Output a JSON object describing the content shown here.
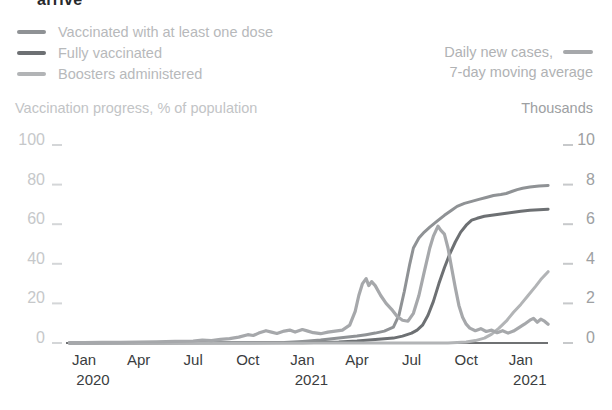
{
  "title_fragment": "arrive",
  "legend": {
    "items": [
      {
        "label": "Vaccinated with at least one dose",
        "color_key": "first_dose"
      },
      {
        "label": "Fully vaccinated",
        "color_key": "fully_vaccinated"
      },
      {
        "label": "Boosters administered",
        "color_key": "boosters"
      }
    ],
    "right_line1": "Daily new cases,",
    "right_line2": "7-day moving average"
  },
  "axes": {
    "left_title": "Vaccination progress, % of population",
    "right_title": "Thousands",
    "left_ticks": [
      100,
      80,
      60,
      40,
      20,
      0
    ],
    "right_ticks": [
      10,
      8,
      6,
      4,
      2,
      0
    ],
    "x_ticks": [
      {
        "m": 0,
        "label": "Jan",
        "year": "2020"
      },
      {
        "m": 3,
        "label": "Apr"
      },
      {
        "m": 6,
        "label": "Jul"
      },
      {
        "m": 9,
        "label": "Oct"
      },
      {
        "m": 12,
        "label": "Jan",
        "year": "2021"
      },
      {
        "m": 15,
        "label": "Apr"
      },
      {
        "m": 18,
        "label": "Jul"
      },
      {
        "m": 21,
        "label": "Oct"
      },
      {
        "m": 24,
        "label": "Jan",
        "year": "2021"
      }
    ]
  },
  "colors": {
    "first_dose": "#8f9295",
    "fully_vaccinated": "#6d7073",
    "boosters": "#b2b4b6",
    "daily_cases": "#a6a8ab",
    "tick_dash_left": "#d4d6d8",
    "tick_dash_right": "#c7c9cb",
    "baseline": "#3f4245"
  },
  "chart_data": {
    "type": "line",
    "x_unit": "months since Jan 2020 (0 = Jan 2020)",
    "x_range": [
      -0.8,
      25.5
    ],
    "left_axis": {
      "label": "Vaccination progress, % of population",
      "range": [
        0,
        100
      ]
    },
    "right_axis": {
      "label": "Daily new cases, 7-day moving average, Thousands",
      "range": [
        0,
        10
      ]
    },
    "grid": false,
    "legend_position": "top",
    "series": [
      {
        "name": "Vaccinated with at least one dose",
        "axis": "left",
        "unit": "% of population",
        "color_key": "first_dose",
        "width": 3,
        "points": [
          [
            -0.8,
            0
          ],
          [
            6,
            0.1
          ],
          [
            11,
            0.2
          ],
          [
            12,
            0.8
          ],
          [
            13,
            1.5
          ],
          [
            14,
            2.5
          ],
          [
            15,
            3.5
          ],
          [
            15.5,
            4.2
          ],
          [
            16,
            5
          ],
          [
            16.5,
            6
          ],
          [
            17,
            8
          ],
          [
            17.3,
            14
          ],
          [
            17.6,
            26
          ],
          [
            17.9,
            40
          ],
          [
            18.1,
            48
          ],
          [
            18.4,
            53
          ],
          [
            18.7,
            56
          ],
          [
            19,
            58.5
          ],
          [
            19.4,
            61.5
          ],
          [
            19.8,
            64.5
          ],
          [
            20.2,
            67
          ],
          [
            20.5,
            69
          ],
          [
            20.9,
            70.5
          ],
          [
            21.3,
            71.5
          ],
          [
            21.7,
            72.5
          ],
          [
            22.1,
            73.5
          ],
          [
            22.5,
            74.5
          ],
          [
            22.9,
            75
          ],
          [
            23.2,
            75.5
          ],
          [
            23.5,
            76.5
          ],
          [
            23.8,
            77.5
          ],
          [
            24.1,
            78.2
          ],
          [
            24.5,
            78.8
          ],
          [
            25,
            79.3
          ],
          [
            25.5,
            79.6
          ]
        ]
      },
      {
        "name": "Fully vaccinated",
        "axis": "left",
        "unit": "% of population",
        "color_key": "fully_vaccinated",
        "width": 3,
        "points": [
          [
            -0.8,
            0
          ],
          [
            12,
            0.1
          ],
          [
            14,
            0.5
          ],
          [
            15,
            1
          ],
          [
            16,
            1.8
          ],
          [
            17,
            2.5
          ],
          [
            17.5,
            3.5
          ],
          [
            18,
            5
          ],
          [
            18.3,
            6.5
          ],
          [
            18.6,
            9
          ],
          [
            18.9,
            14
          ],
          [
            19.2,
            21
          ],
          [
            19.5,
            30
          ],
          [
            19.8,
            38
          ],
          [
            20.1,
            45
          ],
          [
            20.4,
            51
          ],
          [
            20.7,
            56
          ],
          [
            21,
            59.5
          ],
          [
            21.3,
            62
          ],
          [
            21.6,
            63
          ],
          [
            22,
            64
          ],
          [
            22.4,
            64.5
          ],
          [
            22.8,
            65
          ],
          [
            23.2,
            65.5
          ],
          [
            23.6,
            66
          ],
          [
            24,
            66.5
          ],
          [
            24.5,
            67
          ],
          [
            25,
            67.3
          ],
          [
            25.5,
            67.5
          ]
        ]
      },
      {
        "name": "Boosters administered",
        "axis": "left",
        "unit": "% of population",
        "color_key": "boosters",
        "width": 3,
        "points": [
          [
            -0.8,
            0
          ],
          [
            20,
            0
          ],
          [
            21,
            0.5
          ],
          [
            21.5,
            1.2
          ],
          [
            22,
            2.5
          ],
          [
            22.4,
            4.5
          ],
          [
            22.8,
            7.5
          ],
          [
            23.2,
            11
          ],
          [
            23.6,
            15.5
          ],
          [
            24,
            19.5
          ],
          [
            24.4,
            24
          ],
          [
            24.8,
            28.5
          ],
          [
            25.1,
            32
          ],
          [
            25.5,
            36
          ]
        ]
      },
      {
        "name": "Daily new cases, 7-day moving average",
        "axis": "right",
        "unit": "thousands",
        "color_key": "daily_cases",
        "width": 3.2,
        "points": [
          [
            -0.8,
            0.02
          ],
          [
            0,
            0.02
          ],
          [
            1,
            0.03
          ],
          [
            2,
            0.03
          ],
          [
            3,
            0.05
          ],
          [
            4,
            0.06
          ],
          [
            5,
            0.08
          ],
          [
            6,
            0.1
          ],
          [
            6.5,
            0.15
          ],
          [
            7,
            0.12
          ],
          [
            7.5,
            0.18
          ],
          [
            8,
            0.22
          ],
          [
            8.5,
            0.3
          ],
          [
            9,
            0.42
          ],
          [
            9.3,
            0.38
          ],
          [
            9.6,
            0.5
          ],
          [
            10,
            0.62
          ],
          [
            10.3,
            0.55
          ],
          [
            10.6,
            0.48
          ],
          [
            11,
            0.6
          ],
          [
            11.3,
            0.65
          ],
          [
            11.6,
            0.55
          ],
          [
            12,
            0.68
          ],
          [
            12.3,
            0.6
          ],
          [
            12.6,
            0.52
          ],
          [
            13,
            0.47
          ],
          [
            13.4,
            0.55
          ],
          [
            13.8,
            0.6
          ],
          [
            14.2,
            0.65
          ],
          [
            14.6,
            0.9
          ],
          [
            14.9,
            1.6
          ],
          [
            15.1,
            2.4
          ],
          [
            15.3,
            3
          ],
          [
            15.5,
            3.25
          ],
          [
            15.65,
            2.9
          ],
          [
            15.8,
            3.1
          ],
          [
            16,
            2.9
          ],
          [
            16.3,
            2.4
          ],
          [
            16.6,
            2
          ],
          [
            16.9,
            1.7
          ],
          [
            17.2,
            1.35
          ],
          [
            17.5,
            1.15
          ],
          [
            17.8,
            1.1
          ],
          [
            18.1,
            1.5
          ],
          [
            18.4,
            2.4
          ],
          [
            18.7,
            3.6
          ],
          [
            19,
            4.8
          ],
          [
            19.2,
            5.4
          ],
          [
            19.45,
            5.9
          ],
          [
            19.6,
            5.7
          ],
          [
            19.8,
            5.5
          ],
          [
            20,
            4.8
          ],
          [
            20.2,
            3.8
          ],
          [
            20.4,
            2.8
          ],
          [
            20.6,
            1.9
          ],
          [
            20.8,
            1.3
          ],
          [
            21,
            0.95
          ],
          [
            21.2,
            0.75
          ],
          [
            21.5,
            0.62
          ],
          [
            21.8,
            0.72
          ],
          [
            22.1,
            0.58
          ],
          [
            22.4,
            0.65
          ],
          [
            22.7,
            0.52
          ],
          [
            23,
            0.62
          ],
          [
            23.3,
            0.5
          ],
          [
            23.6,
            0.6
          ],
          [
            23.9,
            0.78
          ],
          [
            24.2,
            0.95
          ],
          [
            24.5,
            1.15
          ],
          [
            24.7,
            1.25
          ],
          [
            24.9,
            1.05
          ],
          [
            25.1,
            1.2
          ],
          [
            25.3,
            1.1
          ],
          [
            25.5,
            0.95
          ]
        ]
      }
    ]
  }
}
